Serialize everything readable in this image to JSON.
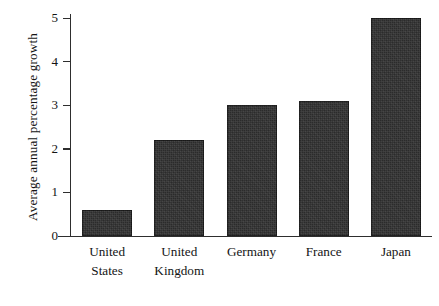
{
  "chart_data": {
    "type": "bar",
    "title": "",
    "subtitle": "",
    "xlabel": "",
    "ylabel": "Average annual percentage growth",
    "categories": [
      "United States",
      "United Kingdom",
      "Germany",
      "France",
      "Japan"
    ],
    "category_lines": [
      [
        "United",
        "States"
      ],
      [
        "United",
        "Kingdom"
      ],
      [
        "Germany"
      ],
      [
        "France"
      ],
      [
        "Japan"
      ]
    ],
    "values": [
      0.6,
      2.2,
      3.0,
      3.1,
      5.0
    ],
    "ylim": [
      0,
      5
    ],
    "ytick_labels": [
      "0",
      "1",
      "2",
      "3",
      "4",
      "5"
    ],
    "ytick_values": [
      0,
      1,
      2,
      3,
      4,
      5
    ],
    "grid": false,
    "legend": false,
    "legend_position": "none",
    "bar_color": "#2b2b2b",
    "axis_color": "#2e2e2e",
    "background_color": "#ffffff",
    "text_color": "#141414"
  },
  "axis": {
    "y_title": "Average annual percentage growth",
    "ticks": [
      {
        "label": "5",
        "value": 5
      },
      {
        "label": "4",
        "value": 4
      },
      {
        "label": "3",
        "value": 3
      },
      {
        "label": "2",
        "value": 2
      },
      {
        "label": "1",
        "value": 1
      },
      {
        "label": "0",
        "value": 0
      }
    ]
  },
  "bars": [
    {
      "name": "united-states",
      "label": "United States",
      "line1": "United",
      "line2": "States",
      "value": 0.6
    },
    {
      "name": "united-kingdom",
      "label": "United Kingdom",
      "line1": "United",
      "line2": "Kingdom",
      "value": 2.2
    },
    {
      "name": "germany",
      "label": "Germany",
      "line1": "Germany",
      "line2": "",
      "value": 3.0
    },
    {
      "name": "france",
      "label": "France",
      "line1": "France",
      "line2": "",
      "value": 3.1
    },
    {
      "name": "japan",
      "label": "Japan",
      "line1": "Japan",
      "line2": "",
      "value": 5.0
    }
  ]
}
